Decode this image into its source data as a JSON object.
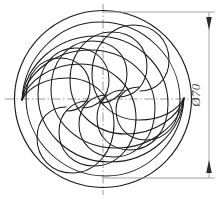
{
  "drawing": {
    "title": "Spiral vane disc technical drawing",
    "view_label": "front-view",
    "line_color": "#1a1a1a",
    "centerline_color": "#8c8c8c",
    "dimension_color": "#9a9a9a",
    "background": "#ffffff"
  },
  "dimensions": [
    {
      "id": "outer-diameter",
      "symbol": "Ø",
      "value": "70",
      "text": "Ø70",
      "orientation": "vertical",
      "placement": "right",
      "arrows": "both-ends-inward"
    }
  ],
  "geometry": {
    "circle": {
      "name": "outer-circle",
      "center_x": 103,
      "center_y": 99,
      "radius": 89,
      "diameter_label": "Ø70"
    },
    "vane_count": 5,
    "symmetry": "180-degree-rotational",
    "convergence_points": [
      {
        "name": "left-hub-point",
        "x": 22,
        "y": 100
      },
      {
        "name": "right-hub-point",
        "x": 186,
        "y": 122
      }
    ]
  },
  "centerlines": [
    {
      "id": "horizontal-centerline",
      "orientation": "horizontal",
      "at": 99
    },
    {
      "id": "vertical-centerline",
      "orientation": "vertical",
      "at": 103
    }
  ],
  "annotations": {
    "diameter_symbol_name": "diameter-symbol",
    "dimension_text": "Ø70"
  }
}
